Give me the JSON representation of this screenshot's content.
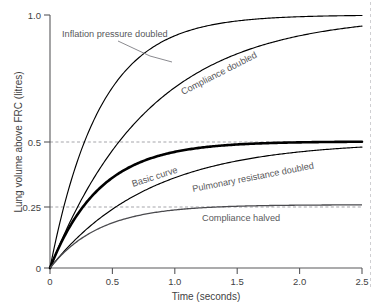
{
  "chart_data": {
    "type": "line",
    "title": "",
    "xlabel": "Time (seconds)",
    "ylabel": "Lung volume above FRC (litres)",
    "xlim": [
      0,
      2.5
    ],
    "ylim": [
      0,
      1.0
    ],
    "xticks": [
      "0",
      "0.5",
      "1.0",
      "1.5",
      "2.0",
      "2.5"
    ],
    "xtick_values": [
      0,
      0.5,
      1.0,
      1.5,
      2.0,
      2.5
    ],
    "yticks": [
      "0",
      "0.25",
      "0.5",
      "1.0"
    ],
    "ytick_values": [
      0,
      0.25,
      0.5,
      1.0
    ],
    "grid": "horizontal dashed reference lines at 0.25 and 0.5",
    "legend": "inline curve annotations",
    "series": [
      {
        "name": "Inflation pressure doubled",
        "label_style": "horizontal with leader line",
        "asymptote": 1.0,
        "time_constant": 0.4,
        "x": [
          0,
          0.1,
          0.2,
          0.3,
          0.4,
          0.5,
          0.6,
          0.7,
          0.8,
          0.9,
          1.0,
          1.25,
          1.5,
          1.75,
          2.0,
          2.25,
          2.5
        ],
        "y": [
          0,
          0.221,
          0.393,
          0.528,
          0.632,
          0.713,
          0.777,
          0.826,
          0.865,
          0.895,
          0.918,
          0.956,
          0.976,
          0.987,
          0.993,
          0.996,
          0.998
        ]
      },
      {
        "name": "Compliance doubled",
        "label_style": "rotated along curve",
        "asymptote": 1.0,
        "time_constant": 0.8,
        "x": [
          0,
          0.1,
          0.2,
          0.3,
          0.4,
          0.5,
          0.6,
          0.7,
          0.8,
          0.9,
          1.0,
          1.25,
          1.5,
          1.75,
          2.0,
          2.25,
          2.5
        ],
        "y": [
          0,
          0.118,
          0.221,
          0.313,
          0.393,
          0.465,
          0.528,
          0.583,
          0.632,
          0.675,
          0.713,
          0.79,
          0.847,
          0.888,
          0.918,
          0.94,
          0.956
        ]
      },
      {
        "name": "Basic curve",
        "label_style": "rotated along curve, bold stroke",
        "asymptote": 0.5,
        "time_constant": 0.4,
        "x": [
          0,
          0.1,
          0.2,
          0.3,
          0.4,
          0.5,
          0.6,
          0.7,
          0.8,
          0.9,
          1.0,
          1.25,
          1.5,
          1.75,
          2.0,
          2.25,
          2.5
        ],
        "y": [
          0,
          0.111,
          0.197,
          0.264,
          0.316,
          0.357,
          0.388,
          0.413,
          0.432,
          0.447,
          0.459,
          0.478,
          0.488,
          0.494,
          0.497,
          0.498,
          0.499
        ]
      },
      {
        "name": "Pulmonary resistance doubled",
        "label_style": "rotated along curve",
        "asymptote": 0.5,
        "time_constant": 0.8,
        "x": [
          0,
          0.1,
          0.2,
          0.3,
          0.4,
          0.5,
          0.6,
          0.7,
          0.8,
          0.9,
          1.0,
          1.25,
          1.5,
          1.75,
          2.0,
          2.25,
          2.5
        ],
        "y": [
          0,
          0.059,
          0.111,
          0.157,
          0.197,
          0.232,
          0.264,
          0.292,
          0.316,
          0.338,
          0.357,
          0.395,
          0.424,
          0.444,
          0.459,
          0.47,
          0.478
        ]
      },
      {
        "name": "Compliance halved",
        "label_style": "horizontal below plateau",
        "asymptote": 0.25,
        "time_constant": 0.4,
        "x": [
          0,
          0.1,
          0.2,
          0.3,
          0.4,
          0.5,
          0.6,
          0.7,
          0.8,
          0.9,
          1.0,
          1.25,
          1.5,
          1.75,
          2.0,
          2.25,
          2.5
        ],
        "y": [
          0,
          0.055,
          0.098,
          0.132,
          0.158,
          0.178,
          0.194,
          0.206,
          0.216,
          0.223,
          0.229,
          0.239,
          0.244,
          0.247,
          0.248,
          0.249,
          0.25
        ]
      }
    ]
  },
  "axes": {
    "ylabel": "Lung volume above FRC (litres)",
    "xlabel": "Time (seconds)",
    "ytick_0": "0",
    "ytick_025": "0.25",
    "ytick_05": "0.5",
    "ytick_10": "1.0",
    "xtick_0": "0",
    "xtick_05": "0.5",
    "xtick_10": "1.0",
    "xtick_15": "1.5",
    "xtick_20": "2.0",
    "xtick_25": "2.5"
  },
  "annotations": {
    "inflation": "Inflation pressure doubled",
    "compliance_doubled": "Compliance doubled",
    "basic": "Basic curve",
    "pulmonary": "Pulmonary resistance doubled",
    "compliance_halved": "Compliance halved"
  },
  "colors": {
    "curve": "#000000",
    "axis": "#58585b",
    "grid": "#9b9ba0",
    "text": "#3f3f43",
    "annotation": "#58585b",
    "background": "#ffffff"
  }
}
